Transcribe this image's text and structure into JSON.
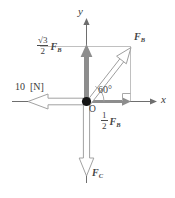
{
  "figure": {
    "background": "#ffffff",
    "colors": {
      "axis": "#6e6e6e",
      "guide": "#b4b4b4",
      "vector_gray": "#8a8a8a",
      "vector_outline": "#9a9a9a",
      "origin_dot": "#111111",
      "text": "#3f3f3f"
    },
    "axes": {
      "x_label": "x",
      "y_label": "y",
      "origin_label": "O"
    },
    "labels": {
      "vertical_component": {
        "numerator": "√3",
        "denominator": "2",
        "force": "F",
        "force_subscript": "B"
      },
      "horizontal_component": {
        "numerator": "1",
        "denominator": "2",
        "force": "F",
        "force_subscript": "B"
      },
      "resultant": {
        "force": "F",
        "force_subscript": "B"
      },
      "downward": {
        "force": "F",
        "force_subscript": "C"
      },
      "applied": {
        "value": "10",
        "unit": "[N]"
      },
      "angle": "60°"
    }
  }
}
